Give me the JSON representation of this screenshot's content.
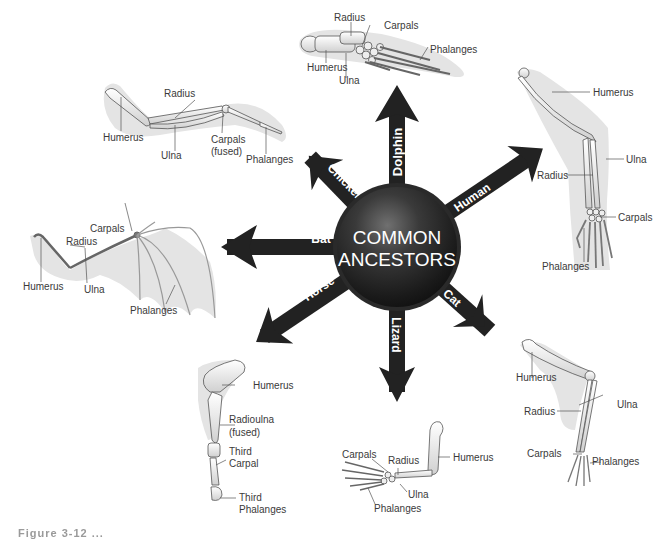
{
  "center": {
    "line1": "COMMON",
    "line2": "ANCESTORS",
    "color_dark": "#1a1a1a",
    "color_highlight": "#6a6a6a"
  },
  "arrows": [
    {
      "id": "dolphin",
      "label": "Dolphin"
    },
    {
      "id": "human",
      "label": "Human"
    },
    {
      "id": "cat",
      "label": "Cat"
    },
    {
      "id": "lizard",
      "label": "Lizard"
    },
    {
      "id": "horse",
      "label": "Horse"
    },
    {
      "id": "bat",
      "label": "Bat"
    },
    {
      "id": "chicken",
      "label": "Chicken"
    }
  ],
  "limbs": {
    "dolphin": {
      "labels": {
        "radius": "Radius",
        "carpals": "Carpals",
        "phalanges": "Phalanges",
        "humerus": "Humerus",
        "ulna": "Ulna"
      }
    },
    "chicken": {
      "labels": {
        "radius": "Radius",
        "humerus": "Humerus",
        "ulna": "Ulna",
        "carpals": "Carpals",
        "carpals_note": "(fused)",
        "phalanges": "Phalanges"
      }
    },
    "human": {
      "labels": {
        "humerus": "Humerus",
        "ulna": "Ulna",
        "radius": "Radius",
        "carpals": "Carpals",
        "phalanges": "Phalanges"
      }
    },
    "bat": {
      "labels": {
        "carpals": "Carpals",
        "radius": "Radius",
        "humerus": "Humerus",
        "ulna": "Ulna",
        "phalanges": "Phalanges"
      }
    },
    "horse": {
      "labels": {
        "humerus": "Humerus",
        "radioulna": "Radioulna",
        "radioulna_note": "(fused)",
        "third_carpal_1": "Third",
        "third_carpal_2": "Carpal",
        "third_phalanges_1": "Third",
        "third_phalanges_2": "Phalanges"
      }
    },
    "lizard": {
      "labels": {
        "carpals": "Carpals",
        "radius": "Radius",
        "humerus": "Humerus",
        "ulna": "Ulna",
        "phalanges": "Phalanges"
      }
    },
    "cat": {
      "labels": {
        "humerus": "Humerus",
        "ulna": "Ulna",
        "radius": "Radius",
        "carpals": "Carpals",
        "phalanges": "Phalanges"
      }
    }
  },
  "caption": {
    "text": "Figure 3-12 ..."
  },
  "colors": {
    "arrow": "#222222",
    "bone": "#f2f2f2",
    "bone_outline": "#555555",
    "shadow": "#e3e3e3",
    "leader": "#555555"
  }
}
